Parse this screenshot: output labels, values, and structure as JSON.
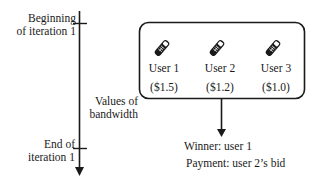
{
  "timeline": {
    "start_label_line1": "Beginning",
    "start_label_line2": "of iteration 1",
    "end_label_line1": "End of",
    "end_label_line2": "iteration 1",
    "values_label_line1": "Values of",
    "values_label_line2": "bandwidth"
  },
  "users": [
    {
      "name": "User 1",
      "bid": "($1.5)",
      "icon": "mobile-phone-icon"
    },
    {
      "name": "User 2",
      "bid": "($1.2)",
      "icon": "mobile-phone-icon"
    },
    {
      "name": "User 3",
      "bid": "($1.0)",
      "icon": "mobile-phone-icon"
    }
  ],
  "result": {
    "winner": "Winner: user 1",
    "payment": "Payment: user 2’s bid"
  },
  "colors": {
    "stroke": "#1a1a1a",
    "background": "#ffffff"
  }
}
